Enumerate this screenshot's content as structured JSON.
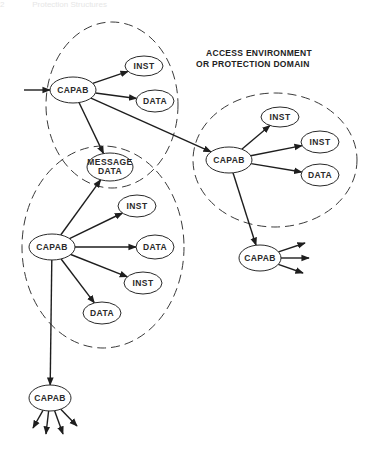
{
  "header": {
    "page_number": "2",
    "running_title": "Protection Structures"
  },
  "annotation": {
    "line1": "ACCESS ENVIRONMENT",
    "line2": "OR PROTECTION DOMAIN"
  },
  "domains": [
    {
      "id": "domain-top"
    },
    {
      "id": "domain-left"
    },
    {
      "id": "domain-right"
    }
  ],
  "nodes": [
    {
      "id": "capab-top",
      "lines": [
        "CAPAB"
      ]
    },
    {
      "id": "inst-top",
      "lines": [
        "INST"
      ]
    },
    {
      "id": "data-top",
      "lines": [
        "DATA"
      ]
    },
    {
      "id": "message-data",
      "lines": [
        "MESSAGE",
        "DATA"
      ]
    },
    {
      "id": "capab-left",
      "lines": [
        "CAPAB"
      ]
    },
    {
      "id": "inst-left-1",
      "lines": [
        "INST"
      ]
    },
    {
      "id": "data-left-1",
      "lines": [
        "DATA"
      ]
    },
    {
      "id": "inst-left-2",
      "lines": [
        "INST"
      ]
    },
    {
      "id": "data-left-2",
      "lines": [
        "DATA"
      ]
    },
    {
      "id": "capab-right",
      "lines": [
        "CAPAB"
      ]
    },
    {
      "id": "inst-right-1",
      "lines": [
        "INST"
      ]
    },
    {
      "id": "inst-right-2",
      "lines": [
        "INST"
      ]
    },
    {
      "id": "data-right",
      "lines": [
        "DATA"
      ]
    },
    {
      "id": "capab-right-lower",
      "lines": [
        "CAPAB"
      ]
    },
    {
      "id": "capab-bottom",
      "lines": [
        "CAPAB"
      ]
    }
  ],
  "edges": [
    {
      "from": "external",
      "to": "capab-top"
    },
    {
      "from": "capab-top",
      "to": "inst-top"
    },
    {
      "from": "capab-top",
      "to": "data-top"
    },
    {
      "from": "capab-top",
      "to": "message-data"
    },
    {
      "from": "capab-top",
      "to": "capab-right"
    },
    {
      "from": "capab-left",
      "to": "message-data"
    },
    {
      "from": "capab-left",
      "to": "inst-left-1"
    },
    {
      "from": "capab-left",
      "to": "data-left-1"
    },
    {
      "from": "capab-left",
      "to": "inst-left-2"
    },
    {
      "from": "capab-left",
      "to": "data-left-2"
    },
    {
      "from": "capab-left",
      "to": "capab-bottom"
    },
    {
      "from": "capab-right",
      "to": "inst-right-1"
    },
    {
      "from": "capab-right",
      "to": "inst-right-2"
    },
    {
      "from": "capab-right",
      "to": "data-right"
    },
    {
      "from": "capab-right",
      "to": "capab-right-lower"
    },
    {
      "from": "capab-right-lower",
      "to": "outgoing-1"
    },
    {
      "from": "capab-right-lower",
      "to": "outgoing-2"
    },
    {
      "from": "capab-right-lower",
      "to": "outgoing-3"
    },
    {
      "from": "capab-bottom",
      "to": "outgoing-1"
    },
    {
      "from": "capab-bottom",
      "to": "outgoing-2"
    },
    {
      "from": "capab-bottom",
      "to": "outgoing-3"
    },
    {
      "from": "capab-bottom",
      "to": "outgoing-4"
    }
  ]
}
